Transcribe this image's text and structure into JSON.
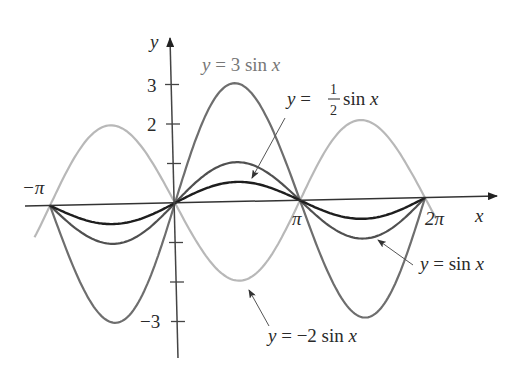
{
  "chart_data": {
    "type": "line",
    "title": "",
    "xlabel": "x",
    "ylabel": "y",
    "xlim": [
      -3.3,
      7.0
    ],
    "ylim": [
      -3.7,
      4.2
    ],
    "grid": false,
    "x_tick_labels": [
      "-π",
      "π",
      "2π"
    ],
    "x_ticks": [
      -3.14159,
      3.14159,
      6.28318
    ],
    "y_tick_labels": [
      "3",
      "2",
      "-3"
    ],
    "y_ticks": [
      3,
      2,
      1,
      -1,
      -2,
      -3
    ],
    "domain": [
      -3.3,
      6.6
    ],
    "series": [
      {
        "name": "y = 3 sin x",
        "amplitude": 3,
        "color": "#6e6e6e",
        "width": 2.2,
        "domain": [
          -3.14159,
          6.28318
        ]
      },
      {
        "name": "y = sin x",
        "amplitude": 1,
        "color": "#505050",
        "width": 2.2,
        "domain": [
          -3.14159,
          6.28318
        ]
      },
      {
        "name": "y = 1/2 sin x",
        "amplitude": 0.5,
        "color": "#1e1e1e",
        "width": 2.4,
        "domain": [
          -3.14159,
          6.28318
        ]
      },
      {
        "name": "y = -2 sin x",
        "amplitude": -2,
        "color": "#b8b8b8",
        "width": 2.2,
        "domain": [
          -3.55,
          6.55
        ]
      }
    ],
    "annotations": [
      {
        "text": "y = 3 sin x",
        "target": "y = 3 sin x"
      },
      {
        "text": "y = 1/2 sin x",
        "target": "y = 1/2 sin x"
      },
      {
        "text": "y = sin x",
        "target": "y = sin x"
      },
      {
        "text": "y = −2 sin x",
        "target": "y = -2 sin x"
      }
    ]
  },
  "labels": {
    "y_axis": "y",
    "x_axis": "x",
    "tick_neg_pi": "−π",
    "tick_pi": "π",
    "tick_2pi": "2π",
    "tick_3": "3",
    "tick_2": "2",
    "tick_neg3": "−3",
    "ann_3sin_y": "y",
    "ann_3sin_rest": " = 3 sin ",
    "ann_3sin_x": "x",
    "ann_half_y": "y",
    "ann_half_eq": " = ",
    "ann_half_num": "1",
    "ann_half_den": "2",
    "ann_half_sin": " sin ",
    "ann_half_x": "x",
    "ann_sin_y": "y",
    "ann_sin_rest": " = sin ",
    "ann_sin_x": "x",
    "ann_neg2_y": "y",
    "ann_neg2_rest": " = −2 sin ",
    "ann_neg2_x": "x"
  }
}
